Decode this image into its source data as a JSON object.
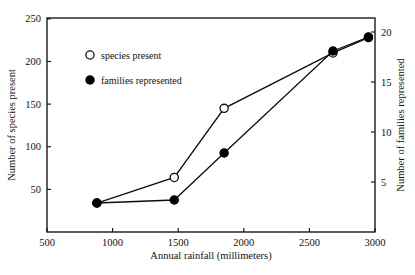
{
  "chart_data": {
    "type": "scatter",
    "title": "",
    "xlabel": "Annual rainfall (millimeters)",
    "ylabel": "Number of species present",
    "ylabel_right": "Number of families represented",
    "xlim": [
      500,
      3000
    ],
    "ylim": [
      0,
      251
    ],
    "ylim_right": [
      0,
      21.4
    ],
    "xticks": [
      500,
      1000,
      1500,
      2000,
      2500,
      3000
    ],
    "xtick_labels": [
      "500",
      "1000",
      "1500",
      "2000",
      "2500",
      "3000"
    ],
    "yticks": [
      50,
      100,
      150,
      200,
      250
    ],
    "ytick_labels": [
      "50",
      "100",
      "150",
      "200",
      "250"
    ],
    "yticks_right": [
      5,
      10,
      15,
      20
    ],
    "ytick_labels_right": [
      "5",
      "10",
      "15",
      "20"
    ],
    "grid": false,
    "legend_position": "upper-left-inside",
    "x": [
      880,
      1470,
      1850,
      2680,
      2950
    ],
    "series": [
      {
        "name": "species present",
        "marker": "open-circle",
        "axis": "left",
        "values": [
          34,
          64,
          145,
          210,
          228
        ]
      },
      {
        "name": "families represented",
        "marker": "filled-circle",
        "axis": "right",
        "values": [
          2.9,
          3.2,
          7.9,
          18.1,
          19.5
        ]
      }
    ]
  },
  "legend": {
    "entries": [
      {
        "label": "species present",
        "marker": "open-circle"
      },
      {
        "label": "families represented",
        "marker": "filled-circle"
      }
    ]
  }
}
